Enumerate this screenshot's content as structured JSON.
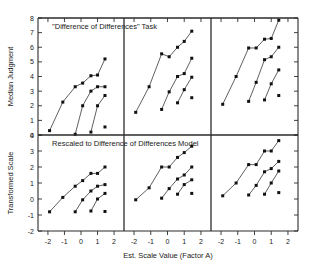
{
  "chart_data": {
    "type": "scatter",
    "title": "",
    "xlabel": "Est. Scale Value  (Factor A)",
    "grid": false,
    "legend": "none",
    "layout": "2 rows x 3 columns of panels sharing the x axis",
    "x_ticks": [
      -2,
      -1,
      0,
      1,
      2
    ],
    "x_tick_labels": [
      "-2",
      "-1",
      "0",
      "1",
      "2"
    ],
    "xlim": [
      -2.6,
      2.6
    ],
    "rows": [
      {
        "row_label": "Median Judgment",
        "ylabel": "Median Judgment",
        "ylim": [
          0,
          8
        ],
        "y_ticks": [
          0,
          1,
          2,
          3,
          4,
          5,
          6,
          7,
          8
        ],
        "y_tick_labels": [
          "0",
          "1",
          "2",
          "3",
          "4",
          "5",
          "6",
          "7",
          "8"
        ],
        "annotation": "\"Difference of Differences\" Task",
        "panels": [
          {
            "panel_index": 0,
            "series": [
              {
                "name": "curve-1",
                "x": [
                  -1.9,
                  -1.1,
                  -0.35,
                  0.1,
                  0.6,
                  1.0,
                  1.45
                ],
                "y": [
                  0.3,
                  2.25,
                  3.3,
                  3.55,
                  4.05,
                  4.1,
                  5.2
                ]
              },
              {
                "name": "curve-2",
                "x": [
                  -0.35,
                  0.1,
                  0.6,
                  1.0,
                  1.45
                ],
                "y": [
                  0.05,
                  2.0,
                  3.0,
                  3.3,
                  3.3
                ]
              },
              {
                "name": "curve-3",
                "x": [
                  0.6,
                  1.0,
                  1.45
                ],
                "y": [
                  0.2,
                  2.0,
                  2.7
                ]
              },
              {
                "name": "point-4",
                "x": [
                  1.45
                ],
                "y": [
                  0.55
                ]
              }
            ]
          },
          {
            "panel_index": 1,
            "series": [
              {
                "name": "curve-1",
                "x": [
                  -1.9,
                  -1.1,
                  -0.35,
                  0.1,
                  0.6,
                  1.0,
                  1.45
                ],
                "y": [
                  1.55,
                  3.3,
                  5.55,
                  5.35,
                  6.0,
                  6.4,
                  7.1
                ]
              },
              {
                "name": "curve-2",
                "x": [
                  -0.35,
                  0.1,
                  0.6,
                  1.0,
                  1.45
                ],
                "y": [
                  1.75,
                  2.95,
                  4.0,
                  4.2,
                  5.25
                ]
              },
              {
                "name": "curve-3",
                "x": [
                  0.6,
                  1.0,
                  1.45
                ],
                "y": [
                  2.2,
                  3.1,
                  3.95
                ]
              },
              {
                "name": "point-4",
                "x": [
                  1.45
                ],
                "y": [
                  2.55
                ]
              }
            ]
          },
          {
            "panel_index": 2,
            "series": [
              {
                "name": "curve-1",
                "x": [
                  -1.9,
                  -1.1,
                  -0.35,
                  0.1,
                  0.6,
                  1.0,
                  1.45
                ],
                "y": [
                  2.1,
                  4.0,
                  5.95,
                  5.95,
                  6.55,
                  6.6,
                  7.85
                ]
              },
              {
                "name": "curve-2",
                "x": [
                  -0.35,
                  0.1,
                  0.6,
                  1.0,
                  1.45
                ],
                "y": [
                  2.3,
                  3.6,
                  5.15,
                  5.35,
                  6.0
                ]
              },
              {
                "name": "curve-3",
                "x": [
                  0.6,
                  1.0,
                  1.45
                ],
                "y": [
                  2.4,
                  3.5,
                  4.45
                ]
              },
              {
                "name": "point-4",
                "x": [
                  1.45
                ],
                "y": [
                  2.7
                ]
              }
            ]
          }
        ]
      },
      {
        "row_label": "Transformed Scale",
        "ylabel": "Transformed Scale",
        "ylim": [
          -2,
          4
        ],
        "y_ticks": [
          -2,
          -1,
          0,
          1,
          2,
          3,
          4
        ],
        "y_tick_labels": [
          "-2",
          "-1",
          "0",
          "1",
          "2",
          "3",
          "4"
        ],
        "annotation": "Rescaled to Difference of Differences Model",
        "panels": [
          {
            "panel_index": 0,
            "series": [
              {
                "name": "curve-1",
                "x": [
                  -1.9,
                  -1.1,
                  -0.35,
                  0.1,
                  0.6,
                  1.0,
                  1.45
                ],
                "y": [
                  -0.8,
                  0.1,
                  0.8,
                  1.15,
                  1.6,
                  1.6,
                  2.0
                ]
              },
              {
                "name": "curve-2",
                "x": [
                  -0.35,
                  0.1,
                  0.6,
                  1.0,
                  1.45
                ],
                "y": [
                  -0.8,
                  -0.05,
                  0.5,
                  0.8,
                  0.9
                ]
              },
              {
                "name": "curve-3",
                "x": [
                  0.6,
                  1.0,
                  1.45
                ],
                "y": [
                  -0.75,
                  0.0,
                  0.35
                ]
              },
              {
                "name": "point-4",
                "x": [
                  1.45
                ],
                "y": [
                  -0.78
                ]
              }
            ]
          },
          {
            "panel_index": 1,
            "series": [
              {
                "name": "curve-1",
                "x": [
                  -1.9,
                  -1.1,
                  -0.35,
                  0.1,
                  0.6,
                  1.0,
                  1.45
                ],
                "y": [
                  -0.05,
                  0.7,
                  2.0,
                  2.0,
                  2.6,
                  2.9,
                  3.3
                ]
              },
              {
                "name": "curve-2",
                "x": [
                  -0.35,
                  0.1,
                  0.6,
                  1.0,
                  1.45
                ],
                "y": [
                  0.05,
                  0.65,
                  1.25,
                  1.5,
                  2.0
                ]
              },
              {
                "name": "curve-3",
                "x": [
                  0.6,
                  1.0,
                  1.45
                ],
                "y": [
                  0.3,
                  0.9,
                  1.2
                ]
              },
              {
                "name": "point-4",
                "x": [
                  1.45
                ],
                "y": [
                  0.35
                ]
              }
            ]
          },
          {
            "panel_index": 2,
            "series": [
              {
                "name": "curve-1",
                "x": [
                  -1.9,
                  -1.1,
                  -0.35,
                  0.1,
                  0.6,
                  1.0,
                  1.45
                ],
                "y": [
                  0.2,
                  1.0,
                  2.15,
                  2.15,
                  3.0,
                  3.0,
                  3.65
                ]
              },
              {
                "name": "curve-2",
                "x": [
                  -0.35,
                  0.1,
                  0.6,
                  1.0,
                  1.45
                ],
                "y": [
                  0.25,
                  0.85,
                  1.7,
                  1.9,
                  2.35
                ]
              },
              {
                "name": "curve-3",
                "x": [
                  0.6,
                  1.0,
                  1.45
                ],
                "y": [
                  0.3,
                  1.0,
                  1.75
                ]
              },
              {
                "name": "point-4",
                "x": [
                  1.45
                ],
                "y": [
                  0.4
                ]
              }
            ]
          }
        ]
      }
    ]
  },
  "labels": {
    "xaxis_title": "Est. Scale Value  (Factor A)",
    "top_yaxis_title": "Median Judgment",
    "bottom_yaxis_title": "Transformed Scale",
    "top_panel_annotation": "\"Difference of Differences\" Task",
    "bottom_panel_annotation": "Rescaled to Difference of Differences Model"
  },
  "colors": {
    "axis": "#2b2b2b",
    "marker": "#111111",
    "line": "#2b2b2b",
    "background": "#ffffff"
  }
}
